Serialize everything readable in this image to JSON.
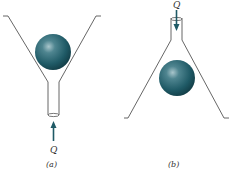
{
  "figure": {
    "panels": [
      {
        "id": "a",
        "caption": "(a)",
        "flow_label": "Q",
        "flow_direction": "up",
        "description": "Sphere resting in upward-opening funnel, flow Q enters from bottom"
      },
      {
        "id": "b",
        "caption": "(b)",
        "flow_label": "Q",
        "flow_direction": "down",
        "description": "Sphere in downward-opening funnel, flow Q enters from top"
      }
    ],
    "colors": {
      "sphere": "#1f5a66",
      "sphere_highlight": "#8fb3ba",
      "line": "#555555",
      "arrow": "#1f5a66"
    }
  }
}
